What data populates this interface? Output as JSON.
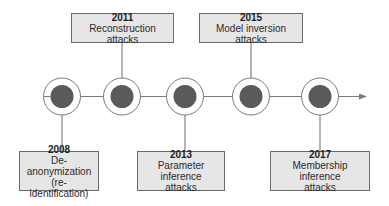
{
  "diagram": {
    "type": "timeline",
    "axis_color": "#7a7a7a",
    "node_fill": "#5a5a5a",
    "node_ring": "#7a7a7a",
    "box_fill": "#e6e6e6",
    "box_border": "#6a6a6a",
    "events": [
      {
        "year": "2008",
        "label_line1": "De-anonymization",
        "label_line2": "(re-identification)",
        "position": "below"
      },
      {
        "year": "2011",
        "label_line1": "Reconstruction attacks",
        "label_line2": "",
        "position": "above"
      },
      {
        "year": "2013",
        "label_line1": "Parameter inference",
        "label_line2": "attacks",
        "position": "below"
      },
      {
        "year": "2015",
        "label_line1": "Model inversion attacks",
        "label_line2": "",
        "position": "above"
      },
      {
        "year": "2017",
        "label_line1": "Membership inference",
        "label_line2": "attacks",
        "position": "below"
      }
    ]
  }
}
